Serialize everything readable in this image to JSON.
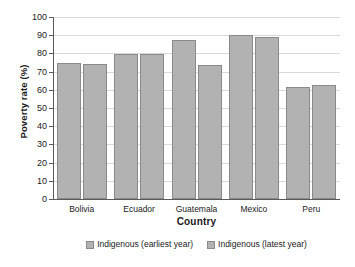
{
  "chart_data": {
    "type": "bar",
    "title": "",
    "xlabel": "Country",
    "ylabel": "Poverty rate (%)",
    "categories": [
      "Bolivia",
      "Ecuador",
      "Guatemala",
      "Mexico",
      "Peru"
    ],
    "series": [
      {
        "name": "Indigenous (earliest year)",
        "values": [
          75,
          79.5,
          87.5,
          90,
          61.5
        ],
        "color": "#b2b2b2"
      },
      {
        "name": "Indigenous (latest year)",
        "values": [
          74,
          79.5,
          73.5,
          89,
          62.5
        ],
        "color": "#b2b2b2"
      }
    ],
    "ylim": [
      0,
      100
    ],
    "yticks": [
      0,
      10,
      20,
      30,
      40,
      50,
      60,
      70,
      80,
      90,
      100
    ],
    "ytick_labels": [
      "0",
      "10",
      "20",
      "30",
      "40",
      "50",
      "60",
      "70",
      "80",
      "90",
      "100"
    ],
    "grid": "horizontal",
    "legend_position": "bottom"
  }
}
